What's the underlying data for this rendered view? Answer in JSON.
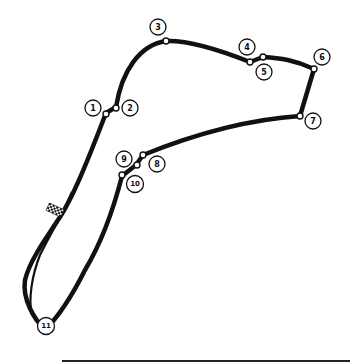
{
  "map": {
    "type": "racing-circuit-layout",
    "start_finish": "checkered-flag-marker",
    "corners": [
      {
        "id": 1,
        "label": "1"
      },
      {
        "id": 2,
        "label": "2"
      },
      {
        "id": 3,
        "label": "3"
      },
      {
        "id": 4,
        "label": "4"
      },
      {
        "id": 5,
        "label": "5"
      },
      {
        "id": 6,
        "label": "6"
      },
      {
        "id": 7,
        "label": "7"
      },
      {
        "id": 8,
        "label": "8"
      },
      {
        "id": 9,
        "label": "9"
      },
      {
        "id": 10,
        "label": "10"
      },
      {
        "id": 11,
        "label": "11"
      }
    ]
  },
  "colors": {
    "track": "#111111",
    "background": "#ffffff"
  }
}
